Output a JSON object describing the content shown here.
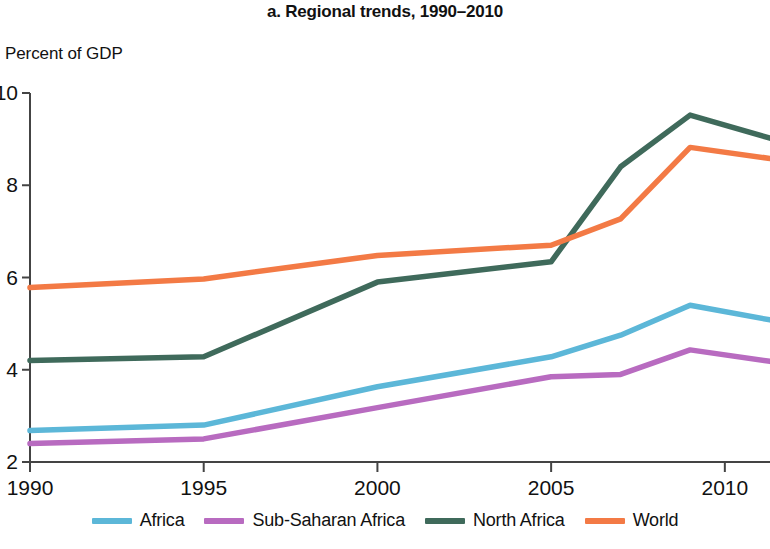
{
  "header": {
    "title": "a. Regional trends, 1990–2010"
  },
  "axes": {
    "y_axis_label": "Percent of GDP",
    "y_ticks": [
      "2",
      "4",
      "6",
      "8",
      "10"
    ],
    "x_ticks": [
      "1990",
      "1995",
      "2000",
      "2005",
      "2010"
    ]
  },
  "legend": {
    "position": "bottom",
    "items": [
      {
        "label": "Africa",
        "color": "#5cb7d8"
      },
      {
        "label": "Sub-Saharan Africa",
        "color": "#b86bc0"
      },
      {
        "label": "North Africa",
        "color": "#3f6a5b"
      },
      {
        "label": "World",
        "color": "#f37a45"
      }
    ]
  },
  "chart_data": {
    "type": "line",
    "title": "a. Regional trends, 1990–2010",
    "xlabel": "",
    "ylabel": "Percent of GDP",
    "xlim": [
      1990,
      2011.3
    ],
    "ylim": [
      2,
      10
    ],
    "grid": false,
    "legend_position": "bottom",
    "x": [
      1990,
      1995,
      2000,
      2005,
      2007,
      2009,
      2011.3
    ],
    "series": [
      {
        "name": "Africa",
        "color": "#5cb7d8",
        "values": [
          2.68,
          2.8,
          3.63,
          4.28,
          4.75,
          5.4,
          5.08
        ]
      },
      {
        "name": "Sub-Saharan Africa",
        "color": "#b86bc0",
        "values": [
          2.4,
          2.5,
          3.18,
          3.85,
          3.9,
          4.43,
          4.18
        ]
      },
      {
        "name": "North Africa",
        "color": "#3f6a5b",
        "values": [
          4.2,
          4.28,
          5.9,
          6.34,
          8.4,
          9.52,
          9.02
        ]
      },
      {
        "name": "World",
        "color": "#f37a45",
        "values": [
          5.78,
          5.97,
          6.48,
          6.7,
          7.27,
          8.82,
          8.58
        ]
      }
    ]
  }
}
